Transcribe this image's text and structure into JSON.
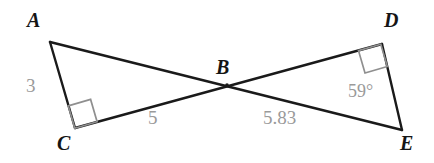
{
  "figure": {
    "type": "geometry-diagram",
    "width": 434,
    "height": 163,
    "background_color": "#ffffff",
    "stroke_color": "#1a1a1a",
    "marker_color": "#8f8f8f",
    "label_color": "#151515",
    "measure_color": "#9a9a9a"
  },
  "points": {
    "A": {
      "label": "A",
      "x": 50,
      "y": 42
    },
    "B": {
      "label": "B",
      "x": 227,
      "y": 85
    },
    "C": {
      "label": "C",
      "x": 75,
      "y": 128
    },
    "D": {
      "label": "D",
      "x": 382,
      "y": 44
    },
    "E": {
      "label": "E",
      "x": 402,
      "y": 130
    }
  },
  "vertex_labels": [
    {
      "name": "vertex-label-a",
      "text": "A",
      "left": 27,
      "top": 10
    },
    {
      "name": "vertex-label-b",
      "text": "B",
      "left": 216,
      "top": 57
    },
    {
      "name": "vertex-label-c",
      "text": "C",
      "left": 57,
      "top": 133
    },
    {
      "name": "vertex-label-d",
      "text": "D",
      "left": 384,
      "top": 10
    },
    {
      "name": "vertex-label-e",
      "text": "E",
      "left": 400,
      "top": 133
    }
  ],
  "segments": [
    {
      "name": "segment-a-e",
      "from": "A",
      "to": "E",
      "note": "passes through B"
    },
    {
      "name": "segment-c-d",
      "from": "C",
      "to": "D",
      "note": "passes through B"
    },
    {
      "name": "segment-a-c",
      "from": "A",
      "to": "C"
    },
    {
      "name": "segment-d-e",
      "from": "D",
      "to": "E"
    }
  ],
  "right_angles": [
    {
      "name": "right-angle-marker-c",
      "at": "C",
      "size": 23
    },
    {
      "name": "right-angle-marker-d",
      "at": "D",
      "size": 23
    }
  ],
  "measures": [
    {
      "name": "measure-label-ac",
      "text": "3",
      "left": 26,
      "top": 76,
      "kind": "length"
    },
    {
      "name": "measure-label-cb",
      "text": "5",
      "left": 148,
      "top": 108,
      "kind": "length"
    },
    {
      "name": "measure-label-be",
      "text": "5.83",
      "left": 263,
      "top": 108,
      "kind": "length"
    },
    {
      "name": "measure-label-angle-e",
      "text": "59°",
      "left": 348,
      "top": 82,
      "kind": "angle"
    }
  ]
}
